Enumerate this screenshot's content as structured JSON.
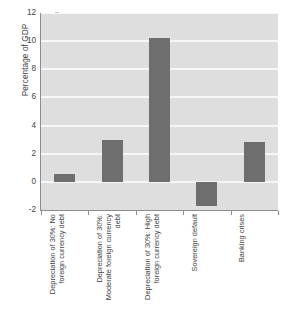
{
  "chart_data": {
    "type": "bar",
    "title": "",
    "xlabel": "",
    "ylabel": "Percentage of GDP",
    "categories": [
      "Depreciation of 30%: No foreign currency debt",
      "Depreciation of 30%: Moderate foreign currency debt",
      "Depreciation of 30%: High foreign currency debt",
      "Sovereign default",
      "Banking crises"
    ],
    "values": [
      0.55,
      3.0,
      10.2,
      -1.7,
      2.85
    ],
    "ylim": [
      -2,
      12
    ],
    "yticks": [
      -2,
      0,
      2,
      4,
      6,
      8,
      10,
      12
    ],
    "ytick_labels": [
      "-2",
      "0",
      "2",
      "4",
      "6",
      "8",
      "10",
      "12"
    ],
    "grid": true,
    "grid_axis": "y",
    "legend": false,
    "bar_color": "#6e6e6e",
    "plot_background": "#dedede",
    "gridline_color": "#f7f7f7",
    "axis_color": "#8d8d8d",
    "text_color": "#3f3f3f"
  }
}
